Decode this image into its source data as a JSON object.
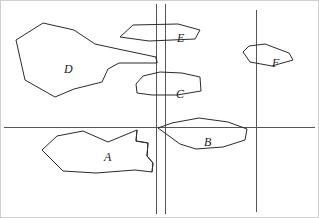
{
  "figure": {
    "width": 319,
    "height": 218,
    "background_color": "#ffffff",
    "stroke_color": "#2b2b2b",
    "line_color": "#555555",
    "border_color": "#cfcfcf"
  },
  "reference_lines": [
    {
      "name": "horizontal-baseline",
      "orientation": "horizontal",
      "y": 127,
      "x1": 4,
      "x2": 315,
      "color": "#555555",
      "width": 1
    },
    {
      "name": "vertical-line-left-inner",
      "orientation": "vertical",
      "x": 156,
      "y1": 4,
      "y2": 214,
      "color": "#555555",
      "width": 1
    },
    {
      "name": "vertical-line-left-outer",
      "orientation": "vertical",
      "x": 165,
      "y1": 4,
      "y2": 214,
      "color": "#555555",
      "width": 1
    },
    {
      "name": "vertical-line-right",
      "orientation": "vertical",
      "x": 256,
      "y1": 10,
      "y2": 212,
      "color": "#555555",
      "width": 1
    }
  ],
  "regions": [
    {
      "id": "A",
      "label": "A",
      "label_x": 104,
      "label_y": 151,
      "points": "42,150 57,136 83,131 108,142 137,130 136,141 148,143 147,156 153,163 152,172 135,170 96,173 63,171"
    },
    {
      "id": "B",
      "label": "B",
      "label_x": 204,
      "label_y": 136,
      "points": "158,128 172,123 199,118 228,122 247,129 245,140 223,147 196,149 180,144"
    },
    {
      "id": "C",
      "label": "C",
      "label_x": 176,
      "label_y": 88,
      "points": "136,84 143,76 160,72 182,73 200,77 201,91 177,95 152,95 137,93"
    },
    {
      "id": "D",
      "label": "D",
      "label_x": 64,
      "label_y": 63,
      "points": "16,40 43,23 74,30 95,44 118,49 156,57 157,63 119,63 108,69 102,82 74,89 55,97 25,80"
    },
    {
      "id": "E",
      "label": "E",
      "label_x": 177,
      "label_y": 32,
      "points": "120,37 133,25 178,24 200,30 195,39 149,41"
    },
    {
      "id": "F",
      "label": "F",
      "label_x": 272,
      "label_y": 57,
      "points": "243,52 249,46 265,44 289,53 293,60 272,66 250,62"
    }
  ],
  "detail_strokes": [
    {
      "name": "region-d-arm-tick",
      "points": "156,57 157,63"
    },
    {
      "name": "region-a-notch",
      "points": "137,130 136,141 148,143 147,156 153,163 152,172"
    }
  ]
}
